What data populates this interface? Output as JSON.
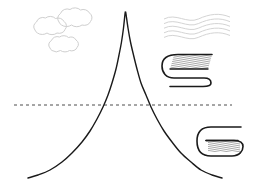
{
  "figure": {
    "title": "",
    "width": 255,
    "height": 189,
    "background_color": "#ffffff"
  },
  "chart_data": {
    "type": "line",
    "title": "",
    "xlabel": "",
    "ylabel": "",
    "xlim": [
      0,
      255
    ],
    "ylim": [
      189,
      0
    ],
    "grid": false,
    "legend": null,
    "series": [
      {
        "name": "peak-curve",
        "stroke_color": "#1a1a1a",
        "stroke_width": 1.4,
        "dash": "solid",
        "closed": false,
        "points": [
          [
            28,
            178
          ],
          [
            38,
            175
          ],
          [
            50,
            170
          ],
          [
            62,
            162
          ],
          [
            72,
            153
          ],
          [
            82,
            142
          ],
          [
            90,
            131
          ],
          [
            97,
            119
          ],
          [
            103,
            107
          ],
          [
            108,
            95
          ],
          [
            112,
            83
          ],
          [
            116,
            69
          ],
          [
            119,
            55
          ],
          [
            121.5,
            42
          ],
          [
            123.5,
            28
          ],
          [
            125,
            14
          ],
          [
            125.5,
            12
          ],
          [
            126,
            14
          ],
          [
            128,
            28
          ],
          [
            130.5,
            42
          ],
          [
            133.5,
            55
          ],
          [
            137,
            69
          ],
          [
            141,
            83
          ],
          [
            146,
            95
          ],
          [
            151,
            107
          ],
          [
            157,
            119
          ],
          [
            164,
            131
          ],
          [
            172,
            142
          ],
          [
            181,
            153
          ],
          [
            191,
            162
          ],
          [
            201,
            170
          ],
          [
            212,
            175
          ],
          [
            222,
            178
          ]
        ]
      }
    ],
    "reference_lines": [
      {
        "name": "baseline",
        "orientation": "horizontal",
        "y": 105,
        "x_start": 14,
        "x_end": 232,
        "color": "#4d4d4d",
        "dash": "3,3",
        "stroke_width": 1
      }
    ],
    "annotations": [
      {
        "name": "cloud-1",
        "kind": "cloud",
        "cx": 48,
        "cy": 27,
        "rx": 17,
        "ry": 9,
        "color": "#cfcfcf"
      },
      {
        "name": "cloud-2",
        "kind": "cloud",
        "cx": 74,
        "cy": 19,
        "rx": 18,
        "ry": 9.5,
        "color": "#cfcfcf"
      },
      {
        "name": "cloud-3",
        "kind": "cloud",
        "cx": 62,
        "cy": 45,
        "rx": 15,
        "ry": 8,
        "color": "#cfcfcf"
      },
      {
        "name": "wave-lines",
        "kind": "waves",
        "x_start": 164,
        "x_end": 230,
        "y_top": 19,
        "line_count": 5,
        "line_gap": 4.6,
        "amplitude": 3.2,
        "color": "#d4d4d4"
      },
      {
        "name": "glyph-upper",
        "kind": "g-glyph",
        "x": 163,
        "y": 52,
        "width": 50,
        "height": 34,
        "stroke_color": "#1a1a1a",
        "hatch_color": "#555555",
        "hatch_angle": 80
      },
      {
        "name": "glyph-lower",
        "kind": "g-glyph",
        "x": 198,
        "y": 125,
        "width": 46,
        "height": 32,
        "stroke_color": "#1a1a1a",
        "hatch_color": "#555555",
        "hatch_angle": 80
      }
    ]
  }
}
